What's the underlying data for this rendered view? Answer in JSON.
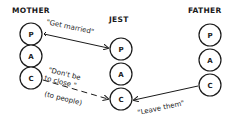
{
  "diagram": {
    "type": "transactional-analysis",
    "colors": {
      "ink": "#1a1a1a",
      "background": "#ffffff"
    },
    "persons": [
      {
        "id": "mother",
        "label": "MOTHER",
        "states": [
          "P",
          "A",
          "C"
        ]
      },
      {
        "id": "jest",
        "label": "JEST",
        "states": [
          "P",
          "A",
          "C"
        ]
      },
      {
        "id": "father",
        "label": "FATHER",
        "states": [
          "P",
          "A",
          "C"
        ]
      }
    ],
    "transactions": [
      {
        "from": "mother.P",
        "to": "jest.P",
        "style": "solid",
        "message": "\"Get married\""
      },
      {
        "from": "mother.C",
        "to": "jest.C",
        "style": "dashed",
        "message_line1": "\"Don't be",
        "message_line2": "to close \"",
        "note": "(to people)"
      },
      {
        "from": "father.C",
        "to": "jest.C",
        "style": "solid",
        "message": "\"Leave them\""
      }
    ]
  }
}
